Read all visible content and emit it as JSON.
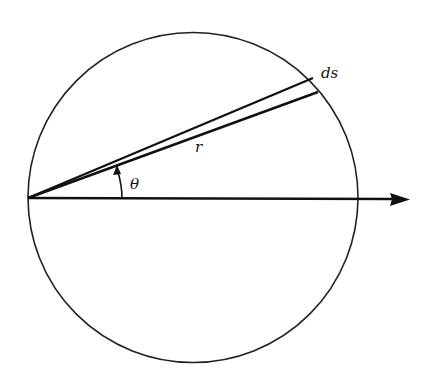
{
  "diagram": {
    "title": "",
    "labels": {
      "ds": "ds",
      "r": "r",
      "theta": "θ"
    },
    "elements": [
      {
        "type": "circle",
        "name": "circle"
      },
      {
        "type": "arrow",
        "name": "horizontal-axis-arrow"
      },
      {
        "type": "line",
        "name": "radius-upper"
      },
      {
        "type": "line",
        "name": "radius-lower"
      },
      {
        "type": "arc-arrow",
        "name": "angle-arc"
      }
    ],
    "colors": {
      "stroke": "#111111",
      "background": "#ffffff"
    }
  }
}
